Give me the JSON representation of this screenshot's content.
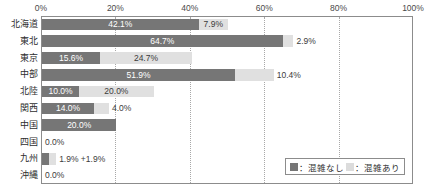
{
  "chart_data": {
    "type": "bar",
    "orientation": "horizontal",
    "stacked": true,
    "title": "",
    "xlabel": "",
    "ylabel": "",
    "xlim": [
      0,
      100
    ],
    "grid": true,
    "legend_position": "bottom-right",
    "tick_labels": [
      "0%",
      "20%",
      "40%",
      "60%",
      "80%",
      "100%"
    ],
    "tick_values": [
      0,
      20,
      40,
      60,
      80,
      100
    ],
    "categories": [
      "北海道",
      "東北",
      "東京",
      "中部",
      "北陸",
      "関西",
      "中国",
      "四国",
      "九州",
      "沖縄"
    ],
    "series": [
      {
        "name": "混雑なし",
        "color": "#767676",
        "values": [
          42.1,
          64.7,
          15.6,
          51.9,
          10.0,
          14.0,
          20.0,
          0.0,
          1.9,
          0.0
        ],
        "labels": [
          "42.1%",
          "64.7%",
          "15.6%",
          "51.9%",
          "10.0%",
          "14.0%",
          "20.0%",
          "0.0%",
          "1.9%",
          "0.0%"
        ]
      },
      {
        "name": "混雑あり",
        "color": "#e0e0e0",
        "values": [
          7.9,
          2.9,
          24.7,
          10.4,
          20.0,
          4.0,
          0.0,
          0.0,
          1.9,
          0.0
        ],
        "labels": [
          "7.9%",
          "2.9%",
          "24.7%",
          "10.4%",
          "20.0%",
          "4.0%",
          "",
          "",
          "+1.9%",
          ""
        ]
      }
    ],
    "rows": [
      {
        "category": "北海道",
        "dark_value": 42.1,
        "dark_label": "42.1%",
        "dark_label_inside": true,
        "light_value": 7.9,
        "light_label": "7.9%",
        "light_label_inside": true
      },
      {
        "category": "東北",
        "dark_value": 64.7,
        "dark_label": "64.7%",
        "dark_label_inside": true,
        "light_value": 2.9,
        "light_label": "2.9%",
        "light_label_inside": false
      },
      {
        "category": "東京",
        "dark_value": 15.6,
        "dark_label": "15.6%",
        "dark_label_inside": true,
        "light_value": 24.7,
        "light_label": "24.7%",
        "light_label_inside": true
      },
      {
        "category": "中部",
        "dark_value": 51.9,
        "dark_label": "51.9%",
        "dark_label_inside": true,
        "light_value": 10.4,
        "light_label": "10.4%",
        "light_label_inside": false
      },
      {
        "category": "北陸",
        "dark_value": 10.0,
        "dark_label": "10.0%",
        "dark_label_inside": true,
        "light_value": 20.0,
        "light_label": "20.0%",
        "light_label_inside": true
      },
      {
        "category": "関西",
        "dark_value": 14.0,
        "dark_label": "14.0%",
        "dark_label_inside": true,
        "light_value": 4.0,
        "light_label": "4.0%",
        "light_label_inside": false
      },
      {
        "category": "中国",
        "dark_value": 20.0,
        "dark_label": "20.0%",
        "dark_label_inside": true,
        "light_value": 0.0,
        "light_label": "",
        "light_label_inside": false
      },
      {
        "category": "四国",
        "dark_value": 0.0,
        "dark_label": "0.0%",
        "dark_label_inside": false,
        "light_value": 0.0,
        "light_label": "",
        "light_label_inside": false
      },
      {
        "category": "九州",
        "dark_value": 1.9,
        "dark_label": "",
        "dark_label_inside": false,
        "light_value": 1.9,
        "light_label": "1.9% +1.9%",
        "light_label_inside": false
      },
      {
        "category": "沖縄",
        "dark_value": 0.0,
        "dark_label": "0.0%",
        "dark_label_inside": false,
        "light_value": 0.0,
        "light_label": "",
        "light_label_inside": false
      }
    ],
    "legend": [
      {
        "marker": "dark-swatch-icon",
        "text": "：混雑なし",
        "color": "#767676"
      },
      {
        "marker": "light-swatch-icon",
        "text": "：混雑あり",
        "color": "#dcdcdc"
      }
    ]
  }
}
